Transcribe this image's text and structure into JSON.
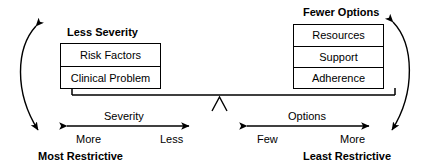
{
  "diagram": {
    "title_top_left": "Less Severity",
    "title_top_right": "Fewer Options",
    "bottom_left_bold": "Most Restrictive",
    "bottom_right_bold": "Least Restrictive",
    "left_box": {
      "rows": [
        "Risk Factors",
        "Clinical Problem"
      ]
    },
    "right_box": {
      "rows": [
        "Resources",
        "Support",
        "Adherence"
      ]
    },
    "left_scale": {
      "name": "Severity",
      "start_label": "More",
      "end_label": "Less"
    },
    "right_scale": {
      "name": "Options",
      "start_label": "Few",
      "end_label": "More"
    },
    "icons": {
      "fulcrum": "fulcrum-triangle-icon",
      "left_arc": "curved-double-arrow-icon",
      "right_arc": "curved-double-arrow-icon",
      "left_axis": "double-headed-arrow-icon",
      "right_axis": "double-headed-arrow-icon",
      "beam": "balance-beam-icon"
    },
    "colors": {
      "stroke": "#000000",
      "background": "#ffffff"
    }
  }
}
